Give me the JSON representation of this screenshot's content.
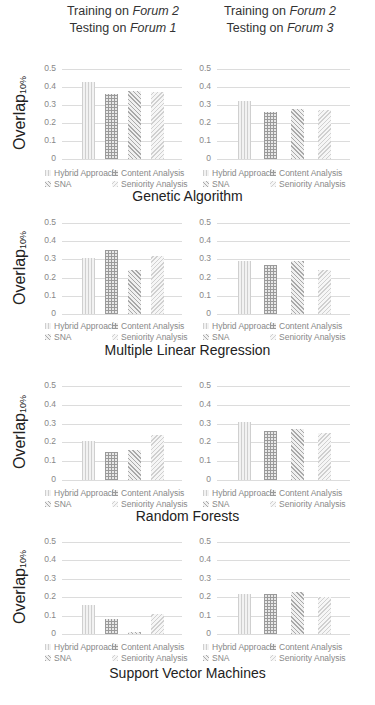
{
  "columns": [
    {
      "line1_prefix": "Training on ",
      "line1_em": "Forum 2",
      "line2_prefix": "Testing on ",
      "line2_em": "Forum 1"
    },
    {
      "line1_prefix": "Training on ",
      "line1_em": "Forum 2",
      "line2_prefix": "Testing on ",
      "line2_em": "Forum 3"
    }
  ],
  "ylabel": {
    "main": "Overlap",
    "sub": "10%"
  },
  "yticks": [
    "0.5",
    "0.4",
    "0.3",
    "0.2",
    "0.1",
    "0"
  ],
  "legend": [
    "Hybrid Approach",
    "Content Analysis",
    "SNA",
    "Seniority Analysis"
  ],
  "sections": [
    {
      "title": "Genetic Algorithm"
    },
    {
      "title": "Multiple Linear Regression"
    },
    {
      "title": "Random Forests"
    },
    {
      "title": "Support Vector Machines"
    }
  ],
  "chart_data": [
    {
      "type": "bar",
      "title": "Genetic Algorithm — Training on Forum 2, Testing on Forum 1",
      "ylabel": "Overlap10%",
      "ylim": [
        0,
        0.5
      ],
      "categories": [
        "Hybrid Approach",
        "Content Analysis",
        "SNA",
        "Seniority Analysis"
      ],
      "values": [
        0.43,
        0.36,
        0.38,
        0.37
      ]
    },
    {
      "type": "bar",
      "title": "Genetic Algorithm — Training on Forum 2, Testing on Forum 3",
      "ylabel": "Overlap10%",
      "ylim": [
        0,
        0.5
      ],
      "categories": [
        "Hybrid Approach",
        "Content Analysis",
        "SNA",
        "Seniority Analysis"
      ],
      "values": [
        0.32,
        0.26,
        0.28,
        0.27
      ]
    },
    {
      "type": "bar",
      "title": "Multiple Linear Regression — Training on Forum 2, Testing on Forum 1",
      "ylabel": "Overlap10%",
      "ylim": [
        0,
        0.5
      ],
      "categories": [
        "Hybrid Approach",
        "Content Analysis",
        "SNA",
        "Seniority Analysis"
      ],
      "values": [
        0.31,
        0.35,
        0.24,
        0.32
      ]
    },
    {
      "type": "bar",
      "title": "Multiple Linear Regression — Training on Forum 2, Testing on Forum 3",
      "ylabel": "Overlap10%",
      "ylim": [
        0,
        0.5
      ],
      "categories": [
        "Hybrid Approach",
        "Content Analysis",
        "SNA",
        "Seniority Analysis"
      ],
      "values": [
        0.29,
        0.27,
        0.29,
        0.24
      ]
    },
    {
      "type": "bar",
      "title": "Random Forests — Training on Forum 2, Testing on Forum 1",
      "ylabel": "Overlap10%",
      "ylim": [
        0,
        0.5
      ],
      "categories": [
        "Hybrid Approach",
        "Content Analysis",
        "SNA",
        "Seniority Analysis"
      ],
      "values": [
        0.21,
        0.15,
        0.16,
        0.24
      ]
    },
    {
      "type": "bar",
      "title": "Random Forests — Training on Forum 2, Testing on Forum 3",
      "ylabel": "Overlap10%",
      "ylim": [
        0,
        0.5
      ],
      "categories": [
        "Hybrid Approach",
        "Content Analysis",
        "SNA",
        "Seniority Analysis"
      ],
      "values": [
        0.31,
        0.26,
        0.27,
        0.25
      ]
    },
    {
      "type": "bar",
      "title": "Support Vector Machines — Training on Forum 2, Testing on Forum 1",
      "ylabel": "Overlap10%",
      "ylim": [
        0,
        0.5
      ],
      "categories": [
        "Hybrid Approach",
        "Content Analysis",
        "SNA",
        "Seniority Analysis"
      ],
      "values": [
        0.16,
        0.08,
        0.01,
        0.11
      ]
    },
    {
      "type": "bar",
      "title": "Support Vector Machines — Training on Forum 2, Testing on Forum 3",
      "ylabel": "Overlap10%",
      "ylim": [
        0,
        0.5
      ],
      "categories": [
        "Hybrid Approach",
        "Content Analysis",
        "SNA",
        "Seniority Analysis"
      ],
      "values": [
        0.22,
        0.22,
        0.23,
        0.2
      ]
    }
  ]
}
